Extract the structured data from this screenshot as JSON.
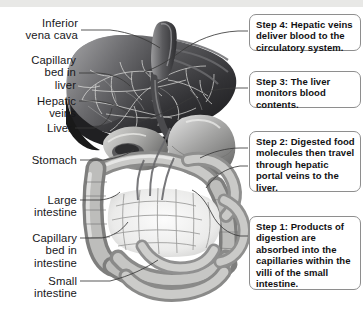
{
  "figure": {
    "background_color": "#ffffff",
    "top_strip_color": "#e8e8e6",
    "line_color": "#3a3a3a",
    "callout_border_color": "#8e8e8e",
    "text_color": "#17171a"
  },
  "labels": [
    {
      "id": "inferior-vena-cava",
      "text": "Inferior\nvena cava"
    },
    {
      "id": "capillary-bed-in-liver",
      "text": "Capillary\nbed in\nliver"
    },
    {
      "id": "hepatic-veins",
      "text": "Hepatic\nveins"
    },
    {
      "id": "liver",
      "text": "Liver"
    },
    {
      "id": "stomach",
      "text": "Stomach"
    },
    {
      "id": "large-intestine",
      "text": "Large\nintestine"
    },
    {
      "id": "capillary-bed-in-intestine",
      "text": "Capillary\nbed in\nintestine"
    },
    {
      "id": "small-intestine",
      "text": "Small\nintestine"
    }
  ],
  "callouts": [
    {
      "id": "step-4",
      "text": "Step 4: Hepatic veins deliver blood to the circulatory system."
    },
    {
      "id": "step-3",
      "text": "Step 3: The liver monitors blood contents."
    },
    {
      "id": "step-2",
      "text": "Step 2: Digested food molecules then travel through hepatic portal veins to the liver."
    },
    {
      "id": "step-1",
      "text": "Step 1: Products of digestion are absorbed into the capillaries within the villi of the small intestine."
    }
  ]
}
